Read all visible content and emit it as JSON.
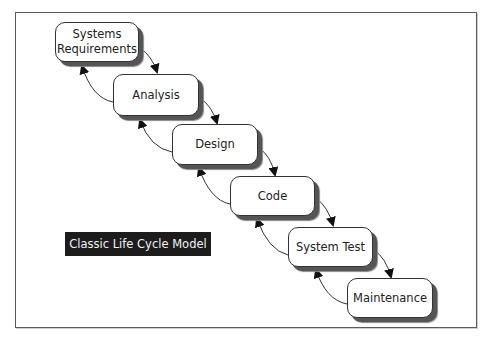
{
  "diagram": {
    "title_label": "Classic Life Cycle Model",
    "stages": [
      {
        "label": "Systems Requirements",
        "line1": "Systems",
        "line2": "Requirements"
      },
      {
        "label": "Analysis"
      },
      {
        "label": "Design"
      },
      {
        "label": "Code"
      },
      {
        "label": "System Test"
      },
      {
        "label": "Maintenance"
      }
    ],
    "connections": [
      {
        "from": "Systems Requirements",
        "to": "Analysis",
        "direction": "forward"
      },
      {
        "from": "Analysis",
        "to": "Systems Requirements",
        "direction": "feedback"
      },
      {
        "from": "Analysis",
        "to": "Design",
        "direction": "forward"
      },
      {
        "from": "Design",
        "to": "Analysis",
        "direction": "feedback"
      },
      {
        "from": "Design",
        "to": "Code",
        "direction": "forward"
      },
      {
        "from": "Code",
        "to": "Design",
        "direction": "feedback"
      },
      {
        "from": "Code",
        "to": "System Test",
        "direction": "forward"
      },
      {
        "from": "System Test",
        "to": "Code",
        "direction": "feedback"
      },
      {
        "from": "System Test",
        "to": "Maintenance",
        "direction": "forward"
      },
      {
        "from": "Maintenance",
        "to": "System Test",
        "direction": "feedback"
      }
    ],
    "colors": {
      "box_fill": "#ffffff",
      "box_border": "#333333",
      "shadow": "#555555",
      "label_bg": "#1c1c1c",
      "label_text": "#f2f2f2",
      "arrow": "#111111"
    }
  }
}
